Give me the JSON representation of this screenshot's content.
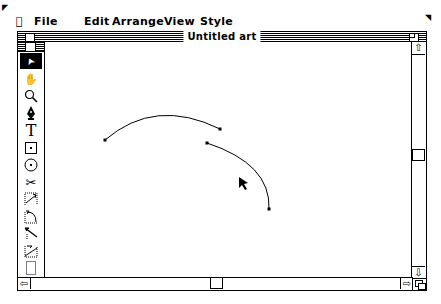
{
  "menubar": {
    "apple_icon": "",
    "items": [
      {
        "label": "File"
      },
      {
        "label": "Edit"
      },
      {
        "label": "Arrange"
      },
      {
        "label": "View"
      },
      {
        "label": "Style"
      }
    ]
  },
  "window": {
    "title": "Untitled art"
  },
  "palette": {
    "tools": [
      {
        "name": "arrow-tool",
        "glyph": "➤",
        "selected": true
      },
      {
        "name": "grabber-hand-tool",
        "glyph": "✋"
      },
      {
        "name": "magnifier-tool",
        "glyph": "🔍︎"
      },
      {
        "name": "pen-tool",
        "glyph": "✒"
      },
      {
        "name": "text-tool",
        "glyph": "T"
      },
      {
        "name": "rectangle-tool",
        "glyph": "⊡"
      },
      {
        "name": "oval-tool",
        "glyph": "⊙"
      },
      {
        "name": "scissors-tool",
        "glyph": "✂"
      },
      {
        "name": "freehand-tool",
        "glyph": "⤴"
      },
      {
        "name": "arc-tool",
        "glyph": "◜"
      },
      {
        "name": "line-tool",
        "glyph": "⤡"
      },
      {
        "name": "polygon-tool",
        "glyph": "⊿"
      },
      {
        "name": "blank-tool",
        "glyph": "⬚"
      }
    ]
  },
  "canvas": {
    "paths": [
      {
        "name": "curve-1",
        "d": "M 60 98 Q 110 60 175 87",
        "anchors": [
          [
            60,
            98
          ],
          [
            175,
            87
          ]
        ]
      },
      {
        "name": "curve-2",
        "d": "M 162 101 Q 225 125 223 167",
        "anchors": [
          [
            162,
            101
          ],
          [
            223,
            167
          ]
        ]
      }
    ],
    "cursor": {
      "x": 194,
      "y": 135
    }
  },
  "scrollbars": {
    "vertical": {
      "thumb_top": 107
    },
    "horizontal": {
      "thumb_left": 175
    }
  }
}
